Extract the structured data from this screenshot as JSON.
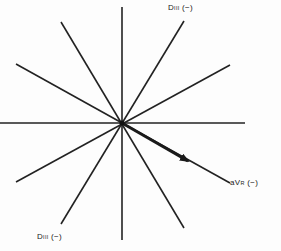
{
  "diagram": {
    "type": "hexaxial-reference-system",
    "center": [
      122,
      123
    ],
    "axis_color": "#222222",
    "arrow_color": "#1a1a1a",
    "axes": [
      {
        "name": "vertical",
        "x1": 122,
        "y1": 7,
        "x2": 122,
        "y2": 240
      },
      {
        "name": "horizontal",
        "x1": 0,
        "y1": 123,
        "x2": 245,
        "y2": 123
      },
      {
        "name": "diag-60-a",
        "x1": 184,
        "y1": 21,
        "x2": 61,
        "y2": 224
      },
      {
        "name": "diag-30-a",
        "x1": 230,
        "y1": 65,
        "x2": 16,
        "y2": 182
      },
      {
        "name": "diag-60-b",
        "x1": 61,
        "y1": 22,
        "x2": 184,
        "y2": 228
      },
      {
        "name": "diag-30-b",
        "x1": 16,
        "y1": 64,
        "x2": 230,
        "y2": 183
      }
    ],
    "vector": {
      "x1": 122,
      "y1": 123,
      "x2": 188,
      "y2": 161
    }
  },
  "labels": {
    "top_right": {
      "main": "D",
      "sub": "III",
      "sign": "(−)"
    },
    "right": {
      "main": "aV",
      "sub": "R",
      "sign": "(−)"
    },
    "bottom_left": {
      "main": "D",
      "sub": "III",
      "sign": "(−)"
    }
  }
}
